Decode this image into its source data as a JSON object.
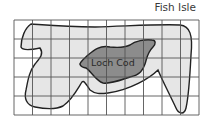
{
  "diagram": {
    "title": "Fish Isle",
    "lake_label": "Loch Cod",
    "grid": {
      "columns": 10,
      "rows": 5
    },
    "colors": {
      "island_fill": "#e6e6e6",
      "lake_fill": "#8c8c8c",
      "outline": "#222222",
      "grid": "#555555"
    }
  }
}
